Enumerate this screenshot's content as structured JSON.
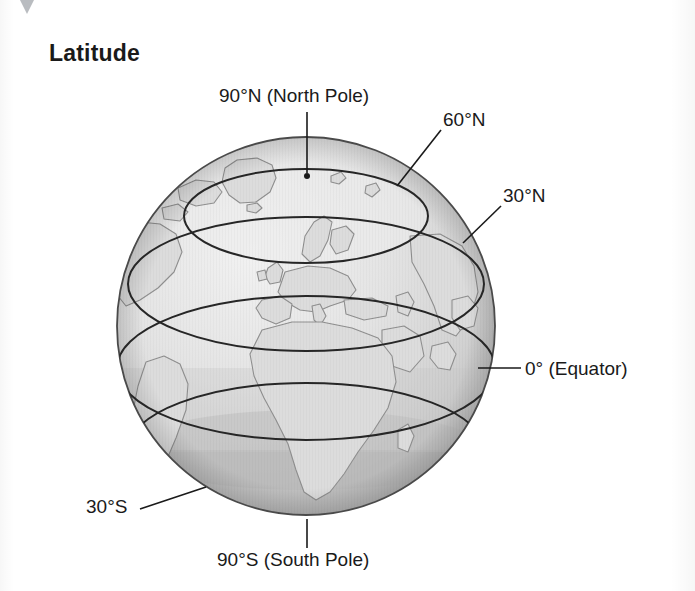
{
  "page": {
    "title": "Latitude",
    "background_color": "#ffffff"
  },
  "diagram": {
    "name": "latitude-globe",
    "type": "globe-illustration",
    "colors": {
      "ocean_fill": "#e3e3e3",
      "polar_band_fill": "#bdbdbd",
      "south_cap_fill": "#b4b4b4",
      "land_outline": "#8c8c8c",
      "latitude_line": "#2b2b2b",
      "globe_outline": "#3a3a3a",
      "label_text": "#1a1a1a",
      "leader_line": "#1a1a1a"
    },
    "sphere": {
      "center_x": 306,
      "center_y": 326,
      "radius": 189
    },
    "labels": [
      {
        "id": "90n",
        "text": "90°N (North Pole)",
        "latitude": 90,
        "hemisphere": "N",
        "leader": "vertical-down-to-pole"
      },
      {
        "id": "60n",
        "text": "60°N",
        "latitude": 60,
        "hemisphere": "N",
        "leader": "diagonal-down-left"
      },
      {
        "id": "30n",
        "text": "30°N",
        "latitude": 30,
        "hemisphere": "N",
        "leader": "diagonal-down-left"
      },
      {
        "id": "equator",
        "text": "0° (Equator)",
        "latitude": 0,
        "hemisphere": "",
        "leader": "horizontal-left"
      },
      {
        "id": "30s",
        "text": "30°S",
        "latitude": -30,
        "hemisphere": "S",
        "leader": "diagonal-up-right"
      },
      {
        "id": "90s",
        "text": "90°S (South Pole)",
        "latitude": -90,
        "hemisphere": "S",
        "leader": "vertical-up-to-pole"
      }
    ],
    "latitude_circles": [
      {
        "label": "60°N",
        "value": 60
      },
      {
        "label": "30°N",
        "value": 30
      },
      {
        "label": "0° (Equator)",
        "value": 0
      },
      {
        "label": "30°S",
        "value": -30
      }
    ]
  }
}
